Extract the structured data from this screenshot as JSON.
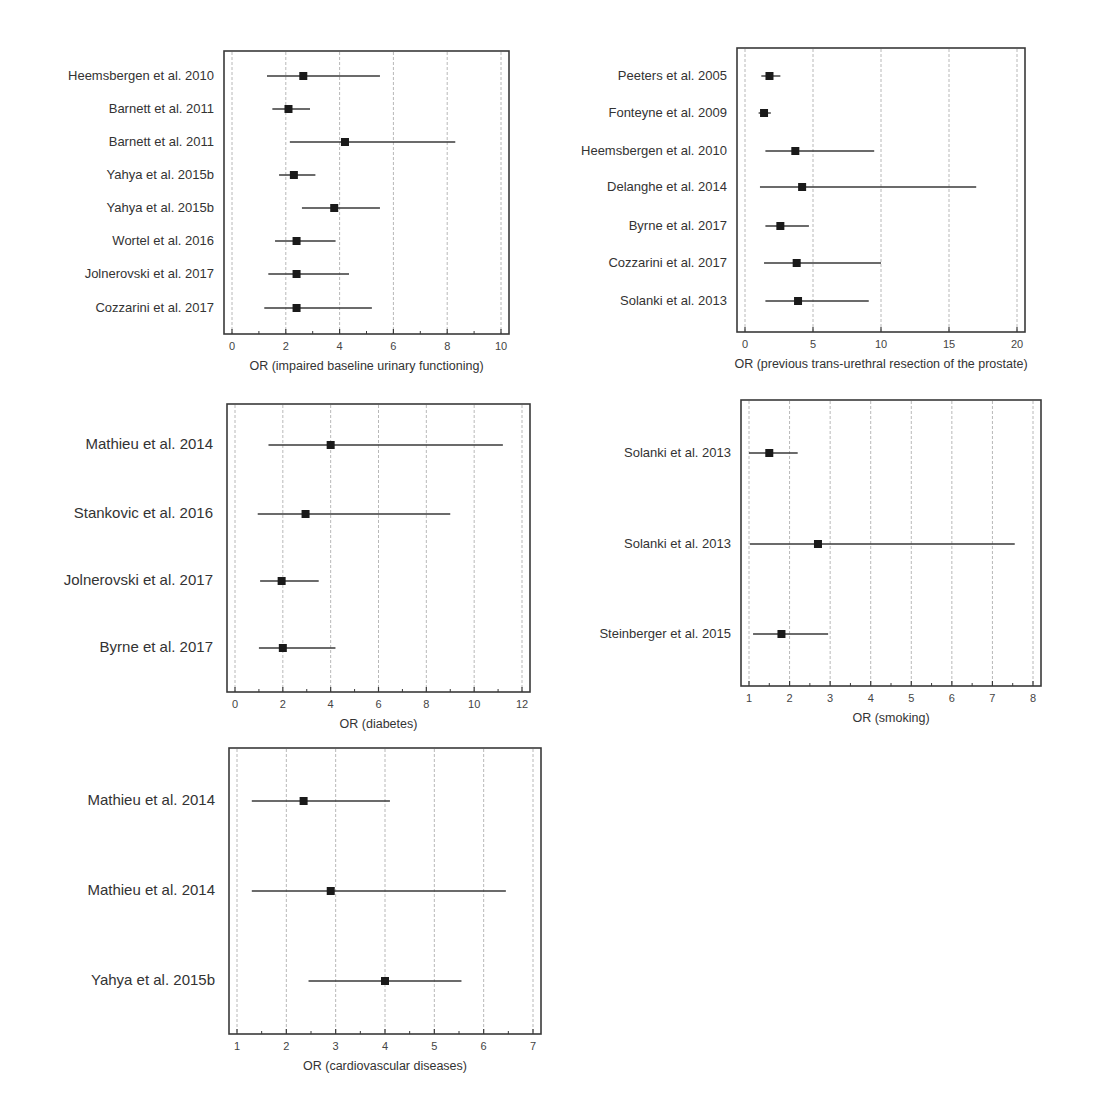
{
  "chart_data": [
    {
      "type": "forest",
      "title": "",
      "xlabel": "OR (impaired baseline urinary functioning)",
      "xlim": [
        0,
        10
      ],
      "xticks": [
        0,
        2,
        4,
        6,
        8,
        10
      ],
      "minor_ticks": true,
      "grid": true,
      "legend": null,
      "box": {
        "left": 224,
        "top": 51,
        "right": 509,
        "bottom": 334
      },
      "label_size": "normal",
      "studies": [
        {
          "label": "Heemsbergen et al. 2010",
          "or": 2.65,
          "lower": 1.3,
          "upper": 5.5,
          "y": 76
        },
        {
          "label": "Barnett et al. 2011",
          "or": 2.1,
          "lower": 1.5,
          "upper": 2.9,
          "y": 109
        },
        {
          "label": "Barnett et al. 2011",
          "or": 4.2,
          "lower": 2.15,
          "upper": 8.3,
          "y": 142
        },
        {
          "label": "Yahya et al. 2015b",
          "or": 2.3,
          "lower": 1.75,
          "upper": 3.1,
          "y": 175
        },
        {
          "label": "Yahya et al. 2015b",
          "or": 3.8,
          "lower": 2.6,
          "upper": 5.5,
          "y": 208
        },
        {
          "label": "Wortel et al. 2016",
          "or": 2.4,
          "lower": 1.6,
          "upper": 3.85,
          "y": 241
        },
        {
          "label": "Jolnerovski et al. 2017",
          "or": 2.4,
          "lower": 1.35,
          "upper": 4.35,
          "y": 274
        },
        {
          "label": "Cozzarini et al. 2017",
          "or": 2.4,
          "lower": 1.2,
          "upper": 5.2,
          "y": 308
        }
      ]
    },
    {
      "type": "forest",
      "title": "",
      "xlabel": "OR (previous trans-urethral resection of the prostate)",
      "xlim": [
        0,
        20
      ],
      "xticks": [
        0,
        5,
        10,
        15,
        20
      ],
      "minor_ticks": false,
      "grid": true,
      "legend": null,
      "box": {
        "left": 737,
        "top": 48,
        "right": 1025,
        "bottom": 332
      },
      "label_size": "normal",
      "studies": [
        {
          "label": "Peeters et al. 2005",
          "or": 1.8,
          "lower": 1.2,
          "upper": 2.6,
          "y": 76
        },
        {
          "label": "Fonteyne et al. 2009",
          "or": 1.4,
          "lower": 1.0,
          "upper": 1.9,
          "y": 113
        },
        {
          "label": "Heemsbergen et al. 2010",
          "or": 3.7,
          "lower": 1.5,
          "upper": 9.5,
          "y": 151
        },
        {
          "label": "Delanghe et al. 2014",
          "or": 4.2,
          "lower": 1.1,
          "upper": 17.0,
          "y": 187
        },
        {
          "label": "Byrne et al. 2017",
          "or": 2.6,
          "lower": 1.5,
          "upper": 4.7,
          "y": 226
        },
        {
          "label": "Cozzarini et al. 2017",
          "or": 3.8,
          "lower": 1.4,
          "upper": 10.0,
          "y": 263
        },
        {
          "label": "Solanki et al. 2013",
          "or": 3.9,
          "lower": 1.5,
          "upper": 9.1,
          "y": 301
        }
      ]
    },
    {
      "type": "forest",
      "title": "",
      "xlabel": "OR (diabetes)",
      "xlim": [
        0,
        12
      ],
      "xticks": [
        0,
        2,
        4,
        6,
        8,
        10,
        12
      ],
      "minor_ticks": true,
      "grid": true,
      "legend": null,
      "box": {
        "left": 227,
        "top": 404,
        "right": 530,
        "bottom": 692
      },
      "label_size": "big",
      "studies": [
        {
          "label": "Mathieu et al. 2014",
          "or": 4.0,
          "lower": 1.4,
          "upper": 11.2,
          "y": 445
        },
        {
          "label": "Stankovic et al. 2016",
          "or": 2.95,
          "lower": 0.95,
          "upper": 9.0,
          "y": 514
        },
        {
          "label": "Jolnerovski et al. 2017",
          "or": 1.95,
          "lower": 1.05,
          "upper": 3.5,
          "y": 581
        },
        {
          "label": "Byrne et al. 2017",
          "or": 2.0,
          "lower": 1.0,
          "upper": 4.2,
          "y": 648
        }
      ]
    },
    {
      "type": "forest",
      "title": "",
      "xlabel": "OR (smoking)",
      "xlim": [
        1,
        8
      ],
      "xticks": [
        1,
        2,
        3,
        4,
        5,
        6,
        7,
        8
      ],
      "minor_ticks": true,
      "grid": true,
      "legend": null,
      "box": {
        "left": 741,
        "top": 400,
        "right": 1041,
        "bottom": 686
      },
      "label_size": "normal",
      "studies": [
        {
          "label": "Solanki et al. 2013",
          "or": 1.5,
          "lower": 1.0,
          "upper": 2.2,
          "y": 453
        },
        {
          "label": "Solanki et al. 2013",
          "or": 2.7,
          "lower": 1.02,
          "upper": 7.55,
          "y": 544
        },
        {
          "label": "Steinberger et al. 2015",
          "or": 1.8,
          "lower": 1.1,
          "upper": 2.95,
          "y": 634
        }
      ]
    },
    {
      "type": "forest",
      "title": "",
      "xlabel": "OR (cardiovascular diseases)",
      "xlim": [
        1,
        7
      ],
      "xticks": [
        1,
        2,
        3,
        4,
        5,
        6,
        7
      ],
      "minor_ticks": true,
      "grid": true,
      "legend": null,
      "box": {
        "left": 229,
        "top": 748,
        "right": 541,
        "bottom": 1034
      },
      "label_size": "big",
      "studies": [
        {
          "label": "Mathieu et al. 2014",
          "or": 2.35,
          "lower": 1.3,
          "upper": 4.1,
          "y": 801
        },
        {
          "label": "Mathieu et al. 2014",
          "or": 2.9,
          "lower": 1.3,
          "upper": 6.45,
          "y": 891
        },
        {
          "label": "Yahya et al. 2015b",
          "or": 4.0,
          "lower": 2.45,
          "upper": 5.55,
          "y": 981
        }
      ]
    }
  ],
  "colors": {
    "frame": "#3a3a3a",
    "grid": "#b8b8b8",
    "ci_line": "#3a3a3a",
    "marker": "#1a1a1a",
    "text": "#333333"
  }
}
